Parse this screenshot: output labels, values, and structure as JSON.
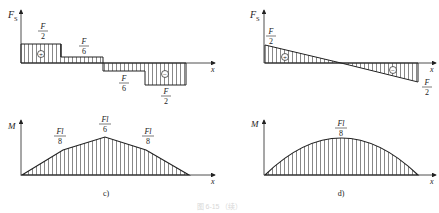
{
  "panels": {
    "c": {
      "label": "c)",
      "shear": {
        "y_axis_label": "F",
        "y_axis_sub": "S",
        "x_axis_label": "x",
        "segments": [
          {
            "num": "F",
            "den": "2",
            "sign": "+"
          },
          {
            "num": "F",
            "den": "6",
            "sign": ""
          },
          {
            "num": "F",
            "den": "6",
            "sign": ""
          },
          {
            "num": "F",
            "den": "2",
            "sign": "−"
          }
        ]
      },
      "moment": {
        "y_axis_label": "M",
        "x_axis_label": "x",
        "peaks": [
          {
            "num": "Fl",
            "den": "8"
          },
          {
            "num": "Fl",
            "den": "6"
          },
          {
            "num": "Fl",
            "den": "8"
          }
        ]
      }
    },
    "d": {
      "label": "d)",
      "shear": {
        "y_axis_label": "F",
        "y_axis_sub": "S",
        "x_axis_label": "x",
        "left": {
          "num": "F",
          "den": "2",
          "sign": "+"
        },
        "right": {
          "num": "F",
          "den": "2",
          "sign": "−"
        }
      },
      "moment": {
        "y_axis_label": "M",
        "x_axis_label": "x",
        "peak": {
          "num": "Fl",
          "den": "8"
        }
      }
    }
  },
  "caption": "图 6-15 （续）",
  "colors": {
    "line": "#222222",
    "hatch": "#444444"
  }
}
